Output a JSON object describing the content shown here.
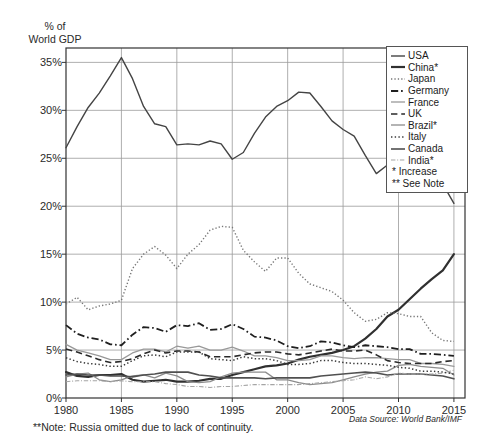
{
  "chart_data": {
    "type": "line",
    "title": "",
    "ylabel": "% of\nWorld GDP",
    "xlabel": "",
    "xlim": [
      1980,
      2016
    ],
    "ylim": [
      0,
      36.5
    ],
    "yticks": [
      0,
      5,
      10,
      15,
      20,
      25,
      30,
      35
    ],
    "ytick_labels": [
      "0%",
      "5%",
      "10%",
      "15%",
      "20%",
      "25%",
      "30%",
      "35%"
    ],
    "xticks": [
      1980,
      1985,
      1990,
      1995,
      2000,
      2005,
      2010,
      2015
    ],
    "xtick_labels": [
      "1980",
      "1985",
      "1990",
      "1995",
      "2000",
      "2005",
      "2010",
      "2015"
    ],
    "grid": true,
    "legend_position": "upper right",
    "x": [
      1980,
      1981,
      1982,
      1983,
      1984,
      1985,
      1986,
      1987,
      1988,
      1989,
      1990,
      1991,
      1992,
      1993,
      1994,
      1995,
      1996,
      1997,
      1998,
      1999,
      2000,
      2001,
      2002,
      2003,
      2004,
      2005,
      2006,
      2007,
      2008,
      2009,
      2010,
      2011,
      2012,
      2013,
      2014,
      2015
    ],
    "series": [
      {
        "name": "USA",
        "label": "USA",
        "style": "solid",
        "width": 1.4,
        "color": "#444444",
        "values": [
          26.1,
          28.3,
          30.3,
          31.8,
          33.6,
          35.5,
          33.3,
          30.4,
          28.6,
          28.3,
          26.4,
          26.5,
          26.4,
          26.8,
          26.5,
          24.9,
          25.6,
          27.6,
          29.3,
          30.4,
          31.0,
          31.9,
          31.8,
          30.4,
          28.9,
          28.0,
          27.3,
          25.3,
          23.4,
          24.3,
          23.0,
          21.7,
          22.2,
          22.2,
          22.3,
          20.3
        ]
      },
      {
        "name": "China",
        "label": "China*",
        "style": "solid",
        "width": 2.2,
        "color": "#303030",
        "values": [
          2.7,
          2.3,
          2.2,
          2.4,
          2.4,
          2.5,
          1.9,
          1.7,
          1.8,
          1.9,
          1.7,
          1.7,
          1.8,
          2.0,
          2.0,
          2.4,
          2.7,
          3.0,
          3.3,
          3.4,
          3.6,
          4.0,
          4.3,
          4.5,
          4.7,
          5.0,
          5.4,
          6.2,
          7.2,
          8.5,
          9.2,
          10.3,
          11.4,
          12.4,
          13.3,
          15.0
        ]
      },
      {
        "name": "Japan",
        "label": "Japan",
        "style": "dotted",
        "width": 1.4,
        "color": "#777777",
        "values": [
          9.8,
          10.5,
          9.2,
          9.6,
          9.8,
          10.2,
          13.5,
          15.0,
          15.8,
          14.9,
          13.5,
          15.0,
          16.0,
          17.5,
          17.9,
          17.8,
          15.4,
          14.2,
          13.2,
          14.6,
          14.6,
          13.0,
          11.9,
          11.5,
          11.1,
          10.2,
          8.9,
          8.0,
          8.2,
          8.9,
          8.8,
          8.5,
          8.5,
          6.8,
          6.0,
          5.9
        ]
      },
      {
        "name": "Germany",
        "label": "Germany",
        "style": "dashdot",
        "width": 1.8,
        "color": "#1f1f1f",
        "values": [
          7.6,
          6.7,
          6.3,
          6.1,
          5.6,
          5.5,
          6.6,
          7.4,
          7.3,
          6.9,
          7.6,
          7.5,
          7.8,
          7.1,
          7.2,
          7.7,
          7.2,
          6.4,
          6.3,
          6.0,
          5.4,
          5.2,
          5.4,
          5.9,
          5.8,
          5.5,
          5.3,
          5.5,
          5.4,
          5.3,
          5.1,
          5.1,
          4.6,
          4.6,
          4.5,
          4.4
        ]
      },
      {
        "name": "France",
        "label": "France",
        "style": "solid",
        "width": 1.3,
        "color": "#999999",
        "values": [
          5.6,
          5.0,
          4.7,
          4.4,
          4.0,
          4.0,
          4.7,
          5.1,
          5.1,
          4.8,
          5.4,
          5.2,
          5.4,
          5.0,
          5.0,
          5.3,
          4.9,
          4.4,
          4.4,
          4.2,
          3.9,
          3.9,
          4.0,
          4.4,
          4.4,
          4.2,
          4.1,
          4.2,
          4.2,
          4.1,
          4.0,
          4.0,
          3.6,
          3.6,
          3.5,
          3.3
        ]
      },
      {
        "name": "UK",
        "label": "UK",
        "style": "dash",
        "width": 1.6,
        "color": "#2a2a2a",
        "values": [
          5.1,
          4.8,
          4.4,
          4.0,
          3.7,
          3.8,
          4.1,
          4.6,
          5.0,
          4.7,
          4.9,
          4.9,
          4.8,
          4.3,
          4.3,
          4.3,
          4.5,
          4.7,
          4.8,
          4.8,
          4.6,
          4.5,
          4.7,
          4.9,
          5.1,
          4.9,
          4.9,
          5.0,
          4.5,
          3.9,
          3.7,
          3.6,
          3.6,
          3.6,
          3.8,
          3.9
        ]
      },
      {
        "name": "Brazil",
        "label": "Brazil*",
        "style": "solid",
        "width": 1.3,
        "color": "#8c8c8c",
        "values": [
          2.2,
          2.5,
          2.6,
          1.9,
          1.7,
          1.9,
          2.3,
          2.4,
          2.1,
          2.6,
          2.3,
          1.7,
          1.6,
          1.7,
          2.2,
          2.6,
          2.7,
          2.7,
          2.7,
          1.9,
          1.9,
          1.6,
          1.4,
          1.5,
          1.6,
          1.9,
          2.2,
          2.5,
          2.7,
          2.8,
          3.4,
          3.5,
          3.3,
          3.2,
          3.1,
          2.4
        ]
      },
      {
        "name": "Italy",
        "label": "Italy",
        "style": "dotted",
        "width": 1.5,
        "color": "#3a3a3a",
        "values": [
          4.2,
          3.8,
          3.6,
          3.5,
          3.3,
          3.3,
          3.9,
          4.4,
          4.5,
          4.3,
          4.8,
          4.8,
          4.8,
          4.1,
          4.0,
          3.9,
          4.3,
          4.1,
          4.1,
          3.9,
          3.5,
          3.5,
          3.6,
          3.9,
          3.9,
          3.7,
          3.6,
          3.6,
          3.5,
          3.4,
          3.2,
          3.1,
          2.8,
          2.8,
          2.7,
          2.5
        ]
      },
      {
        "name": "Canada",
        "label": "Canada",
        "style": "solid",
        "width": 1.6,
        "color": "#505050",
        "values": [
          2.4,
          2.5,
          2.4,
          2.4,
          2.3,
          2.3,
          2.2,
          2.4,
          2.5,
          2.7,
          2.7,
          2.7,
          2.4,
          2.3,
          2.1,
          2.1,
          2.1,
          2.1,
          2.0,
          2.1,
          2.1,
          2.1,
          2.1,
          2.3,
          2.4,
          2.5,
          2.6,
          2.7,
          2.6,
          2.4,
          2.5,
          2.5,
          2.5,
          2.4,
          2.3,
          2.0
        ]
      },
      {
        "name": "India",
        "label": "India*",
        "style": "dashdot",
        "width": 1.1,
        "color": "#a5a5a5",
        "values": [
          1.7,
          1.8,
          1.8,
          1.8,
          1.7,
          1.8,
          1.7,
          1.7,
          1.7,
          1.5,
          1.4,
          1.2,
          1.2,
          1.1,
          1.2,
          1.2,
          1.3,
          1.4,
          1.4,
          1.4,
          1.4,
          1.4,
          1.5,
          1.6,
          1.7,
          1.8,
          1.9,
          2.2,
          2.0,
          2.2,
          2.6,
          2.5,
          2.5,
          2.5,
          2.6,
          2.9
        ]
      }
    ],
    "legend_notes": [
      "* Increase",
      "** See Note"
    ],
    "footnote": "**Note: Russia omitted due to lack of continuity.",
    "source": "Data Source: World Bank/IMF"
  },
  "colors": {
    "axis": "#333333",
    "grid": "#9a9a9a",
    "background": "#ffffff"
  }
}
